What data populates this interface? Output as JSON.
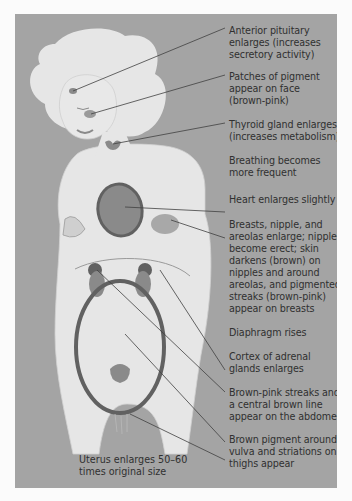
{
  "diagram": {
    "colors": {
      "panel_background": "#a4a4a4",
      "figure_fill": "#e6e6e6",
      "organ_fill": "#8a8a8a",
      "organ_outline": "#616161",
      "text": "#303030"
    },
    "labels": [
      {
        "id": "anterior-pituitary",
        "lines": [
          "Anterior pituitary",
          "enlarges (increases",
          "secretory activity)"
        ]
      },
      {
        "id": "face-pigment",
        "lines": [
          "Patches of pigment",
          "appear on face",
          "(brown-pink)"
        ]
      },
      {
        "id": "thyroid",
        "lines": [
          "Thyroid gland enlarges",
          "(increases metabolism)"
        ]
      },
      {
        "id": "breathing",
        "lines": [
          "Breathing becomes",
          "more frequent"
        ]
      },
      {
        "id": "heart",
        "lines": [
          "Heart enlarges slightly"
        ]
      },
      {
        "id": "breasts",
        "lines": [
          "Breasts, nipple, and",
          "areolas enlarge; nipples",
          "become erect; skin",
          "darkens (brown) on",
          "nipples and around",
          "areolas, and pigmented",
          "streaks (brown-pink)",
          "appear on breasts"
        ]
      },
      {
        "id": "diaphragm",
        "lines": [
          "Diaphragm rises"
        ]
      },
      {
        "id": "adrenal",
        "lines": [
          "Cortex of adrenal",
          "glands enlarges"
        ]
      },
      {
        "id": "abdomen",
        "lines": [
          "Brown-pink streaks and",
          "a central brown line",
          "appear on the abdomen"
        ]
      },
      {
        "id": "vulva",
        "lines": [
          "Brown pigment around",
          "vulva and striations on",
          "thighs appear"
        ]
      }
    ],
    "caption": {
      "lines": [
        "Uterus enlarges 50–60",
        "times original size"
      ]
    }
  }
}
